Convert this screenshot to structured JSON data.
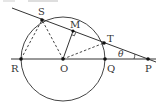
{
  "diagram": {
    "type": "geometry",
    "colors": {
      "stroke": "#333333",
      "background": "#ffffff",
      "faint": "#cfcfcf"
    },
    "circle": {
      "center": "O",
      "cx": 63,
      "cy": 59,
      "r": 42
    },
    "points": {
      "S": {
        "label": "S",
        "x": 42,
        "y": 20
      },
      "M": {
        "label": "M",
        "x": 73,
        "y": 31
      },
      "T": {
        "label": "T",
        "x": 104,
        "y": 43
      },
      "R": {
        "label": "R",
        "x": 21,
        "y": 59
      },
      "O": {
        "label": "O",
        "x": 63,
        "y": 59
      },
      "Q": {
        "label": "Q",
        "x": 105,
        "y": 59
      },
      "P": {
        "label": "P",
        "x": 148,
        "y": 59
      }
    },
    "angle": {
      "label": "θ",
      "at": "P",
      "between": [
        "PT",
        "PQ"
      ]
    },
    "solid_segments": [
      [
        "line-left-end",
        "P-right-end"
      ],
      [
        "R",
        "P"
      ],
      [
        "O",
        "M"
      ]
    ],
    "dashed_segments": [
      [
        "R",
        "S"
      ],
      [
        "O",
        "S"
      ],
      [
        "O",
        "T"
      ]
    ],
    "right_angle_at": "M"
  }
}
